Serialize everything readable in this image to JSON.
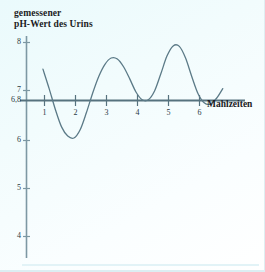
{
  "figure": {
    "background_color": "#f2fcfd",
    "ink_color": "#4a6b78",
    "text_color": "#1b1b23"
  },
  "chart_data": {
    "type": "line",
    "title": "gemessener\npH-Wert des Urins",
    "title_line1": "gemessener",
    "title_line2": "pH-Wert des Urins",
    "xlabel": "Mahlzeiten",
    "ylabel": "gemessener pH-Wert des Urins",
    "grid": false,
    "legend": false,
    "xlim": [
      0.35,
      7.0
    ],
    "ylim": [
      3.7,
      8.35
    ],
    "baseline_value": 6.8,
    "baseline_label": "6,8",
    "xticks": [
      1,
      2,
      3,
      4,
      5,
      6
    ],
    "xtick_labels": [
      "1",
      "2",
      "3",
      "4",
      "5",
      "6"
    ],
    "yticks": [
      8,
      7,
      6.8,
      6,
      5,
      4
    ],
    "ytick_labels": [
      "8",
      "7",
      "6,8",
      "6",
      "5",
      "4"
    ],
    "series": [
      {
        "name": "pH-Wert des Urins",
        "x": [
          0.95,
          1.15,
          1.35,
          1.55,
          1.75,
          1.95,
          2.15,
          2.35,
          2.55,
          2.75,
          2.95,
          3.15,
          3.35,
          3.55,
          3.75,
          3.95,
          4.15,
          4.35,
          4.55,
          4.75,
          4.95,
          5.15,
          5.35,
          5.55,
          5.75,
          5.95,
          6.15,
          6.35,
          6.55,
          6.75
        ],
        "y": [
          7.45,
          7.05,
          6.62,
          6.26,
          6.07,
          6.03,
          6.2,
          6.55,
          6.95,
          7.3,
          7.55,
          7.68,
          7.66,
          7.5,
          7.25,
          6.98,
          6.82,
          6.82,
          7.0,
          7.35,
          7.72,
          7.93,
          7.92,
          7.68,
          7.3,
          6.95,
          6.76,
          6.73,
          6.85,
          7.05
        ]
      }
    ],
    "annotations": []
  }
}
